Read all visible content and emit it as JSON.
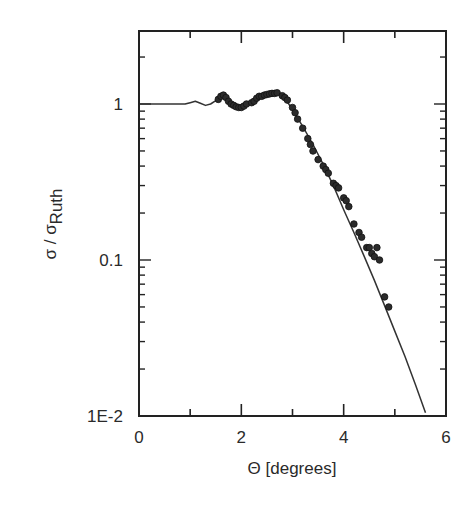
{
  "chart_data": {
    "type": "scatter",
    "title": "",
    "xlabel": "Θ [degrees]",
    "ylabel": "σ / σRuth",
    "ylabel_main": "σ / σ",
    "ylabel_sub": "Ruth",
    "xlim": [
      0,
      6
    ],
    "ylim": [
      0.01,
      2.9
    ],
    "yscale": "log",
    "grid": false,
    "legend": null,
    "x_ticks": [
      {
        "value": 0,
        "label": "0"
      },
      {
        "value": 2,
        "label": "2"
      },
      {
        "value": 4,
        "label": "4"
      },
      {
        "value": 6,
        "label": "6"
      }
    ],
    "y_ticks": [
      {
        "value": 1,
        "label": "1"
      },
      {
        "value": 0.1,
        "label": "0.1"
      },
      {
        "value": 0.01,
        "label": "1E-2"
      }
    ],
    "series": [
      {
        "name": "calculation",
        "kind": "line",
        "x": [
          0.0,
          0.5,
          0.9,
          1.0,
          1.1,
          1.2,
          1.3,
          1.4,
          1.5,
          1.6,
          1.7,
          1.8,
          1.9,
          2.0,
          2.1,
          2.2,
          2.3,
          2.4,
          2.5,
          2.6,
          2.7,
          2.8,
          2.9,
          3.0,
          3.2,
          3.4,
          3.6,
          3.8,
          4.0,
          4.2,
          4.4,
          4.6,
          4.8,
          5.0,
          5.2,
          5.4,
          5.6
        ],
        "y": [
          1.0,
          1.0,
          1.0,
          1.02,
          1.04,
          1.01,
          0.98,
          1.0,
          1.05,
          1.1,
          1.07,
          1.02,
          0.98,
          0.97,
          1.0,
          1.05,
          1.1,
          1.14,
          1.17,
          1.18,
          1.17,
          1.12,
          1.03,
          0.92,
          0.72,
          0.55,
          0.41,
          0.3,
          0.21,
          0.15,
          0.106,
          0.074,
          0.051,
          0.035,
          0.024,
          0.016,
          0.0105
        ]
      },
      {
        "name": "data",
        "kind": "markers",
        "x": [
          1.55,
          1.6,
          1.65,
          1.7,
          1.75,
          1.8,
          1.85,
          1.9,
          1.95,
          2.0,
          2.05,
          2.1,
          2.2,
          2.25,
          2.3,
          2.35,
          2.4,
          2.45,
          2.5,
          2.55,
          2.6,
          2.65,
          2.7,
          2.8,
          2.85,
          2.9,
          3.0,
          3.05,
          3.1,
          3.2,
          3.3,
          3.35,
          3.4,
          3.5,
          3.6,
          3.65,
          3.7,
          3.8,
          3.85,
          3.9,
          4.0,
          4.05,
          4.1,
          4.2,
          4.3,
          4.35,
          4.45,
          4.5,
          4.55,
          4.6,
          4.65,
          4.7,
          4.8,
          4.88
        ],
        "y": [
          1.07,
          1.12,
          1.14,
          1.1,
          1.04,
          1.0,
          0.98,
          0.96,
          0.95,
          0.95,
          0.97,
          1.0,
          1.02,
          1.04,
          1.09,
          1.12,
          1.12,
          1.14,
          1.15,
          1.16,
          1.17,
          1.17,
          1.18,
          1.13,
          1.1,
          1.06,
          0.95,
          0.88,
          0.8,
          0.7,
          0.6,
          0.55,
          0.5,
          0.44,
          0.4,
          0.38,
          0.36,
          0.31,
          0.3,
          0.29,
          0.25,
          0.24,
          0.22,
          0.17,
          0.15,
          0.14,
          0.12,
          0.12,
          0.11,
          0.105,
          0.12,
          0.1,
          0.058,
          0.05
        ]
      }
    ]
  }
}
